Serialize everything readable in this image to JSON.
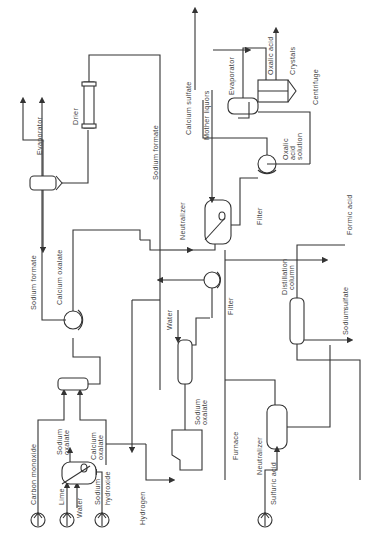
{
  "diagram": {
    "type": "process-flow",
    "orientation": "rotated-90-ccw",
    "inputs": {
      "carbon_monoxide": "Carbon monoxide",
      "lime": "Lime",
      "water": "Water",
      "sodium": "Sodium",
      "hydroxide": "hydroxide",
      "hydrogen": "Hydrogen",
      "sulfuric_acid": "Sulfuric acid"
    },
    "streams": {
      "sodium_oxalate_a": "Sodium",
      "sodium_oxalate_b": "oxalate",
      "calcium_oxalate_a": "Calcium",
      "calcium_oxalate_b": "oxalate",
      "sodium_formate_1": "Sodium  formate",
      "calcium_oxalate_1": "Calcium  oxalate",
      "evaporator_out": "Evaporator",
      "drier": "Drier",
      "sodium_formate_2": "Sodium  formate",
      "calcium_sulfate": "Calcium  sulfate",
      "mother_liquors": "Mother  liquors",
      "water_2": "Water",
      "sodium_oxalate_furnace_a": "Sodium",
      "sodium_oxalate_furnace_b": "oxalate",
      "filter_1": "Filter",
      "filter_2": "Filter",
      "oxalic_acid_solution_a": "Oxalic",
      "oxalic_acid_solution_b": "acid",
      "oxalic_acid_solution_c": "solution",
      "formic_acid": "Formic  acid",
      "sodium_sulfate_a": "Sodium",
      "sodium_sulfate_b": "sulfate",
      "oxalic_acid_out": "Oxalic  acid",
      "crystals": "Crystals"
    },
    "equipment": {
      "furnace": "Furnace",
      "neutralizer_1": "Neutralizer",
      "neutralizer_2": "Neutralizer",
      "distillation_a": "Distillation",
      "distillation_b": "column",
      "evaporator": "Evaporator",
      "centrifuge": "Centrifuge"
    }
  }
}
